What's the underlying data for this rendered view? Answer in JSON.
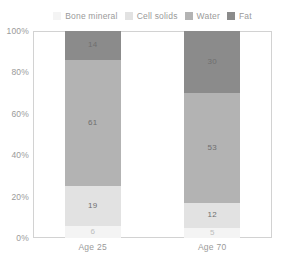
{
  "chart_data": {
    "type": "bar",
    "subtype": "stacked-100-percent",
    "title": "",
    "xlabel": "",
    "ylabel": "",
    "categories": [
      "Age 25",
      "Age 70"
    ],
    "ylim": [
      0,
      100
    ],
    "ytick_labels": [
      "0%",
      "20%",
      "40%",
      "60%",
      "80%",
      "100%"
    ],
    "ytick_values": [
      0,
      20,
      40,
      60,
      80,
      100
    ],
    "grid": false,
    "legend_position": "top-center",
    "series": [
      {
        "name": "Bone mineral",
        "color": "#f4f4f4",
        "values": [
          6,
          5
        ]
      },
      {
        "name": "Cell solids",
        "color": "#e2e2e2",
        "values": [
          19,
          12
        ]
      },
      {
        "name": "Water",
        "color": "#b3b3b3",
        "values": [
          61,
          53
        ]
      },
      {
        "name": "Fat",
        "color": "#8b8b8b",
        "values": [
          14,
          30
        ]
      }
    ],
    "stack_order_top_to_bottom": [
      "Fat",
      "Water",
      "Cell solids",
      "Bone mineral"
    ]
  },
  "legend": {
    "items": [
      {
        "label": "Bone mineral",
        "color": "#f4f4f4"
      },
      {
        "label": "Cell solids",
        "color": "#e2e2e2"
      },
      {
        "label": "Water",
        "color": "#b3b3b3"
      },
      {
        "label": "Fat",
        "color": "#8b8b8b"
      }
    ]
  },
  "axes": {
    "y_ticks": [
      {
        "label": "100%",
        "value": 100
      },
      {
        "label": "80%",
        "value": 80
      },
      {
        "label": "60%",
        "value": 60
      },
      {
        "label": "40%",
        "value": 40
      },
      {
        "label": "20%",
        "value": 20
      },
      {
        "label": "0%",
        "value": 0
      }
    ],
    "x_labels": [
      "Age 25",
      "Age 70"
    ]
  },
  "bars": [
    {
      "category": "Age 25",
      "segments": [
        {
          "series": "Fat",
          "value": 14,
          "label": "14",
          "color": "#8b8b8b"
        },
        {
          "series": "Water",
          "value": 61,
          "label": "61",
          "color": "#b3b3b3"
        },
        {
          "series": "Cell solids",
          "value": 19,
          "label": "19",
          "color": "#e2e2e2"
        },
        {
          "series": "Bone mineral",
          "value": 6,
          "label": "6",
          "color": "#f4f4f4"
        }
      ]
    },
    {
      "category": "Age 70",
      "segments": [
        {
          "series": "Fat",
          "value": 30,
          "label": "30",
          "color": "#8b8b8b"
        },
        {
          "series": "Water",
          "value": 53,
          "label": "53",
          "color": "#b3b3b3"
        },
        {
          "series": "Cell solids",
          "value": 12,
          "label": "12",
          "color": "#e2e2e2"
        },
        {
          "series": "Bone mineral",
          "value": 5,
          "label": "5",
          "color": "#f4f4f4"
        }
      ]
    }
  ]
}
